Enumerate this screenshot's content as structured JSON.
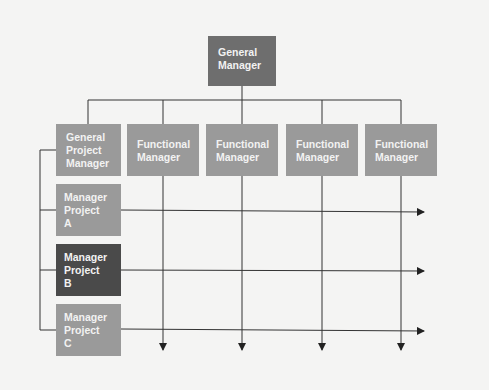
{
  "diagram": {
    "type": "matrix-organization-chart",
    "general_manager": {
      "line1": "General",
      "line2": "Manager"
    },
    "general_project_manager": {
      "line1": "General",
      "line2": "Project",
      "line3": "Manager"
    },
    "functional_managers": [
      {
        "line1": "Functional",
        "line2": "Manager"
      },
      {
        "line1": "Functional",
        "line2": "Manager"
      },
      {
        "line1": "Functional",
        "line2": "Manager"
      },
      {
        "line1": "Functional",
        "line2": "Manager"
      }
    ],
    "project_managers": [
      {
        "line1": "Manager",
        "line2": "Project",
        "line3": "A"
      },
      {
        "line1": "Manager",
        "line2": "Project",
        "line3": "B"
      },
      {
        "line1": "Manager",
        "line2": "Project",
        "line3": "C"
      }
    ],
    "colors": {
      "general_manager": "#6e6e6e",
      "standard_box": "#9a9a9a",
      "highlighted_project": "#4a4a4a",
      "lines": "#333333",
      "background": "#f4f4f3"
    }
  }
}
